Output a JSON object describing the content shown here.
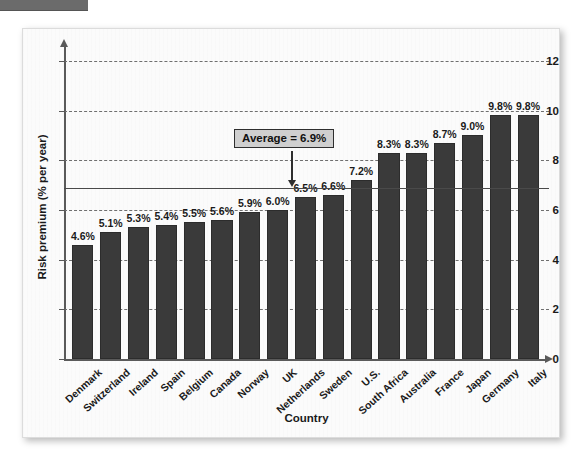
{
  "chart_data": {
    "type": "bar",
    "title": "",
    "xlabel": "Country",
    "ylabel": "Risk premium (% per year)",
    "ylim": [
      0,
      13
    ],
    "ytick_labels": [
      "0",
      "2",
      "4",
      "6",
      "8",
      "10",
      "12"
    ],
    "ytick_values": [
      0,
      2,
      4,
      6,
      8,
      10,
      12
    ],
    "grid": "horizontal dashed gridlines at 2,4,6,8,10,12",
    "legend": "none",
    "categories": [
      "Denmark",
      "Switzerland",
      "Ireland",
      "Spain",
      "Belgium",
      "Canada",
      "Norway",
      "UK",
      "Netherlands",
      "Sweden",
      "U.S.",
      "South Africa",
      "Australia",
      "France",
      "Japan",
      "Germany",
      "Italy"
    ],
    "values": [
      4.6,
      5.1,
      5.3,
      5.4,
      5.5,
      5.6,
      5.9,
      6.0,
      6.5,
      6.6,
      7.2,
      8.3,
      8.3,
      8.7,
      9.0,
      9.8,
      9.8
    ],
    "value_labels": [
      "4.6%",
      "5.1%",
      "5.3%",
      "5.4%",
      "5.5%",
      "5.6%",
      "5.9%",
      "6.0%",
      "6.5%",
      "6.6%",
      "7.2%",
      "8.3%",
      "8.3%",
      "8.7%",
      "9.0%",
      "9.8%",
      "9.8%"
    ],
    "annotations": [
      {
        "label": "Average = 6.9%",
        "value": 6.9,
        "type": "reference-line-callout"
      }
    ],
    "colors": {
      "bar_fill": "#3a3a3a",
      "bar_edge": "#2c2c2c",
      "gridline": "#6f6f6f",
      "average_line": "#4a4a4a",
      "callout_fill": "#cfcfcf",
      "panel_background": "#fbfbfb",
      "text": "#1a1a1a"
    }
  },
  "annotation": {
    "average_label": "Average = 6.9%"
  },
  "axes": {
    "y_title": "Risk premium (% per year)",
    "x_title": "Country"
  }
}
